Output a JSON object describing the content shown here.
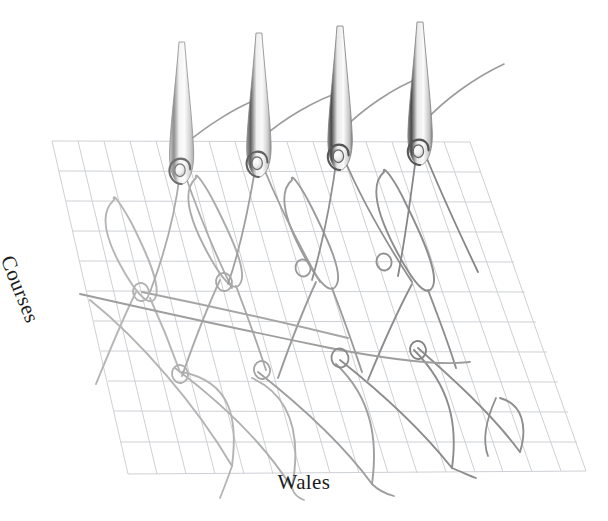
{
  "figure": {
    "background_color": "#ffffff",
    "axes": {
      "horizontal": {
        "label": "Wales"
      },
      "vertical": {
        "label": "Courses",
        "rotation_deg": 68
      }
    },
    "grid": {
      "color": "#cdd0d4",
      "line_width": 1.0,
      "corners": {
        "top_left": [
          52,
          141
        ],
        "top_right": [
          470,
          142
        ],
        "bottom_right": [
          586,
          471
        ],
        "bottom_left": [
          128,
          474
        ]
      },
      "columns": 16,
      "rows": 11
    },
    "needles": {
      "count": 4,
      "shaft_color_light": "#f2f2f2",
      "shaft_color_dark": "#6d6d6d",
      "outline_color": "#8a8a8a",
      "positions": [
        {
          "x": 182,
          "tip_y": 42,
          "hook_y": 172,
          "shade": "light"
        },
        {
          "x": 259,
          "tip_y": 33,
          "hook_y": 163,
          "shade": "medium"
        },
        {
          "x": 340,
          "tip_y": 26,
          "hook_y": 155,
          "shade": "dark"
        },
        {
          "x": 420,
          "tip_y": 22,
          "hook_y": 148,
          "shade": "dark"
        }
      ]
    },
    "yarn": {
      "feed_color": "#9a9a9a",
      "loop_color_light": "#b0b0b0",
      "loop_color_mid": "#9a9a9a",
      "loop_color_dark": "#7c7c7c",
      "stroke_width": 1.9,
      "course_rows": 2,
      "loops_per_row": 4,
      "interlock_rings": 8
    }
  }
}
